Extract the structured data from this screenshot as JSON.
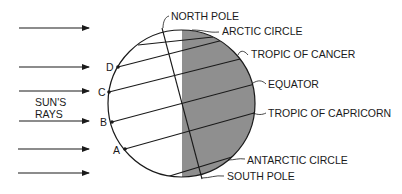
{
  "diagram": {
    "colors": {
      "line": "#1a1a1a",
      "night": "#8f8f8f",
      "day": "#ffffff"
    },
    "sun_label_line1": "SUN'S",
    "sun_label_line2": "RAYS",
    "points": [
      {
        "id": "D",
        "label": "D"
      },
      {
        "id": "C",
        "label": "C"
      },
      {
        "id": "B",
        "label": "B"
      },
      {
        "id": "A",
        "label": "A"
      }
    ],
    "callouts": {
      "north_pole": "NORTH POLE",
      "arctic_circle": "ARCTIC CIRCLE",
      "tropic_of_cancer": "TROPIC OF CANCER",
      "equator": "EQUATOR",
      "tropic_of_capricorn": "TROPIC OF CAPRICORN",
      "antarctic_circle": "ANTARCTIC CIRCLE",
      "south_pole": "SOUTH POLE"
    },
    "ray_count": 6
  }
}
